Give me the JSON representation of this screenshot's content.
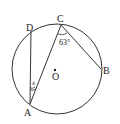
{
  "diagram": {
    "labels": {
      "A": "A",
      "B": "B",
      "C": "C",
      "D": "D",
      "O": "O"
    },
    "angles": {
      "at_C": "63°",
      "at_A": "x"
    },
    "colors": {
      "stroke": "#333333",
      "text": "#222222",
      "background": "#ffffff"
    }
  }
}
